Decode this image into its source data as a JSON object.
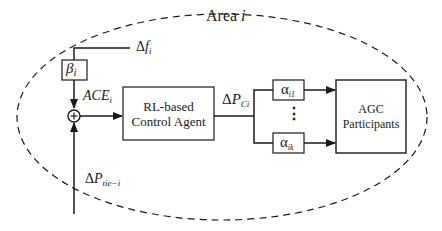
{
  "diagram": {
    "area_label": {
      "prefix": "Area ",
      "var": "i"
    },
    "inputs": {
      "delta_f": {
        "symbol": "Δ",
        "var": "f",
        "sub": "i"
      },
      "delta_p_tie": {
        "symbol": "Δ",
        "var": "P",
        "sub": "tie−i"
      }
    },
    "beta_block": {
      "var": "β",
      "sub": "i"
    },
    "ace_label": {
      "var": "ACE",
      "sub": "i"
    },
    "summer": {
      "sign": "+"
    },
    "agent_block": {
      "line1": "RL-based",
      "line2": "Control Agent"
    },
    "delta_pc_label": {
      "symbol": "Δ",
      "var": "P",
      "sub": "Ci"
    },
    "alpha_blocks": [
      {
        "var": "α",
        "sub": "i1"
      },
      {
        "var": "α",
        "sub": "ik"
      }
    ],
    "ellipsis": "⋮",
    "agc_block": {
      "line1": "AGC",
      "line2": "Participants"
    },
    "colors": {
      "line": "#1a1a1a",
      "background": "#ffffff"
    }
  }
}
